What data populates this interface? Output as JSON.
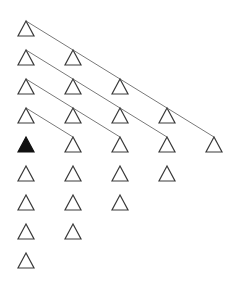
{
  "diagram": {
    "type": "triangle-grid",
    "colors": {
      "stroke": "#3a3a3a",
      "line": "#7a7a7a",
      "filled": "#111111",
      "background": "#ffffff"
    },
    "columns_x": [
      26,
      73,
      120,
      167,
      214
    ],
    "rows_y": [
      21,
      50,
      79,
      108,
      137,
      166,
      195,
      224,
      253
    ],
    "triangle": {
      "half_width": 8,
      "height": 15
    },
    "nodes": [
      {
        "col": 0,
        "row": 0,
        "filled": false
      },
      {
        "col": 0,
        "row": 1,
        "filled": false
      },
      {
        "col": 0,
        "row": 2,
        "filled": false
      },
      {
        "col": 0,
        "row": 3,
        "filled": false
      },
      {
        "col": 0,
        "row": 4,
        "filled": true
      },
      {
        "col": 0,
        "row": 5,
        "filled": false
      },
      {
        "col": 0,
        "row": 6,
        "filled": false
      },
      {
        "col": 0,
        "row": 7,
        "filled": false
      },
      {
        "col": 0,
        "row": 8,
        "filled": false
      },
      {
        "col": 1,
        "row": 1,
        "filled": false
      },
      {
        "col": 1,
        "row": 2,
        "filled": false
      },
      {
        "col": 1,
        "row": 3,
        "filled": false
      },
      {
        "col": 1,
        "row": 4,
        "filled": false
      },
      {
        "col": 1,
        "row": 5,
        "filled": false
      },
      {
        "col": 1,
        "row": 6,
        "filled": false
      },
      {
        "col": 1,
        "row": 7,
        "filled": false
      },
      {
        "col": 2,
        "row": 2,
        "filled": false
      },
      {
        "col": 2,
        "row": 3,
        "filled": false
      },
      {
        "col": 2,
        "row": 4,
        "filled": false
      },
      {
        "col": 2,
        "row": 5,
        "filled": false
      },
      {
        "col": 2,
        "row": 6,
        "filled": false
      },
      {
        "col": 3,
        "row": 3,
        "filled": false
      },
      {
        "col": 3,
        "row": 4,
        "filled": false
      },
      {
        "col": 3,
        "row": 5,
        "filled": false
      },
      {
        "col": 4,
        "row": 4,
        "filled": false
      }
    ],
    "edges": [
      {
        "from": {
          "col": 0,
          "row": 0
        },
        "to": {
          "col": 4,
          "row": 4
        }
      },
      {
        "from": {
          "col": 0,
          "row": 1
        },
        "to": {
          "col": 3,
          "row": 4
        }
      },
      {
        "from": {
          "col": 0,
          "row": 2
        },
        "to": {
          "col": 2,
          "row": 4
        }
      },
      {
        "from": {
          "col": 0,
          "row": 3
        },
        "to": {
          "col": 1,
          "row": 4
        }
      }
    ]
  }
}
